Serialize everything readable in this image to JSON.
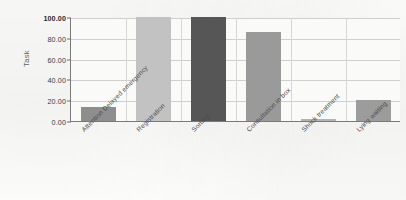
{
  "chart_data": {
    "type": "bar",
    "title": "",
    "xlabel": "",
    "ylabel": "Task",
    "categories": [
      "Attention Delayed emergency",
      "Registration",
      "Sorting",
      "Consultation in box",
      "Shock treatment",
      "Lying waiting"
    ],
    "values": [
      13,
      100,
      100,
      86,
      2,
      20
    ],
    "ylim": [
      0,
      100
    ],
    "ytick_labels": [
      "0.00",
      "20.00",
      "40.00",
      "60.00",
      "80.00",
      "100.00"
    ],
    "ytick_values": [
      0,
      20,
      40,
      60,
      80,
      100
    ],
    "grid": "horizontal-and-vertical",
    "legend": "none",
    "bar_colors": [
      "#8e8e8e",
      "#c2c2c2",
      "#565656",
      "#9a9a9a",
      "#b4b4b4",
      "#9c9c9c"
    ]
  },
  "colors": {
    "axis": "#7a7a7a",
    "gridline": "#cfcfcf",
    "plot_background": "#fafaf9",
    "page_background": "#fbfbfa",
    "tick_text": "#3a3a3a",
    "label_text": "#4a4a4a"
  }
}
